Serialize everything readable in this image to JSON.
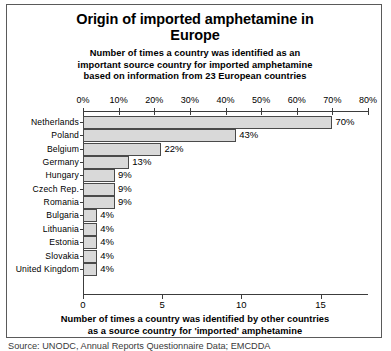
{
  "chart_data": {
    "type": "bar",
    "orientation": "horizontal",
    "title": "Origin of imported amphetamine in Europe",
    "title_lines": [
      "Origin of imported amphetamine in",
      "Europe"
    ],
    "subtitle_lines": [
      "Number of times a country was identified as an",
      "important source country for imported amphetamine",
      "based on information from 23 European countries"
    ],
    "categories": [
      "Netherlands",
      "Poland",
      "Belgium",
      "Germany",
      "Hungary",
      "Czech Rep.",
      "Romania",
      "Bulgaria",
      "Lithuania",
      "Estonia",
      "Slovakia",
      "United Kingdom"
    ],
    "values_percent": [
      70,
      43,
      22,
      13,
      9,
      9,
      9,
      4,
      4,
      4,
      4,
      4
    ],
    "value_labels": [
      "70%",
      "43%",
      "22%",
      "13%",
      "9%",
      "9%",
      "9%",
      "4%",
      "4%",
      "4%",
      "4%",
      "4%"
    ],
    "values_count": [
      16.1,
      9.9,
      5.1,
      3.0,
      2.0,
      2.0,
      2.0,
      1.0,
      1.0,
      1.0,
      1.0,
      1.0
    ],
    "top_axis": {
      "label": "",
      "ticks": [
        0,
        10,
        20,
        30,
        40,
        50,
        60,
        70,
        80
      ],
      "tick_labels": [
        "0%",
        "10%",
        "20%",
        "30%",
        "40%",
        "50%",
        "60%",
        "70%",
        "80%"
      ],
      "range": [
        0,
        80
      ]
    },
    "bottom_axis": {
      "ticks": [
        0,
        5,
        10,
        15
      ],
      "tick_labels": [
        "0",
        "5",
        "10",
        "15"
      ],
      "range": [
        0,
        18
      ]
    },
    "xlabel_lines": [
      "Number of times a country was identified by other countries",
      "as a source country for 'imported' amphetamine"
    ],
    "grid": false,
    "legend": "none",
    "bar_fill_color": "#d9d9d9",
    "bar_border_color": "#4a4a4a",
    "axis_color": "#3c3c3c"
  },
  "source_note": "Source: UNODC, Annual Reports Questionnaire Data; EMCDDA"
}
